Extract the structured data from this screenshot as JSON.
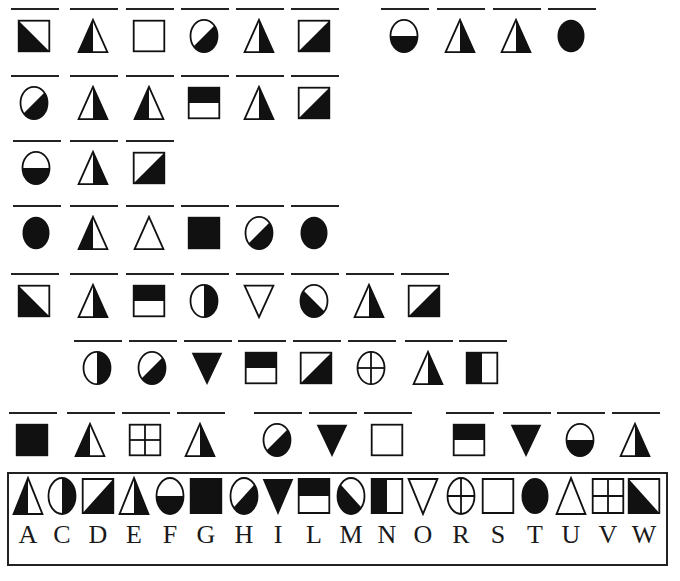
{
  "puzzle": {
    "type": "symbol-substitution-cipher",
    "rows": [
      {
        "y": 18,
        "glyphs": [
          {
            "x": 16,
            "shape": "W"
          },
          {
            "x": 75,
            "shape": "A"
          },
          {
            "x": 131,
            "shape": "S"
          },
          {
            "x": 186,
            "shape": "H"
          },
          {
            "x": 241,
            "shape": "E"
          },
          {
            "x": 296,
            "shape": "D"
          },
          {
            "x": 386,
            "shape": "F"
          },
          {
            "x": 442,
            "shape": "E"
          },
          {
            "x": 498,
            "shape": "E"
          },
          {
            "x": 553,
            "shape": "T"
          }
        ],
        "word_text": "WASHED FEET"
      },
      {
        "y": 85,
        "glyphs": [
          {
            "x": 16,
            "shape": "H"
          },
          {
            "x": 75,
            "shape": "E"
          },
          {
            "x": 131,
            "shape": "A"
          },
          {
            "x": 186,
            "shape": "L"
          },
          {
            "x": 241,
            "shape": "E"
          },
          {
            "x": 296,
            "shape": "D"
          }
        ],
        "word_text": "HEALED"
      },
      {
        "y": 150,
        "glyphs": [
          {
            "x": 18,
            "shape": "F"
          },
          {
            "x": 75,
            "shape": "E"
          },
          {
            "x": 131,
            "shape": "D"
          }
        ],
        "word_text": "FED"
      },
      {
        "y": 215,
        "glyphs": [
          {
            "x": 18,
            "shape": "T"
          },
          {
            "x": 75,
            "shape": "A"
          },
          {
            "x": 131,
            "shape": "U"
          },
          {
            "x": 186,
            "shape": "G"
          },
          {
            "x": 241,
            "shape": "H"
          },
          {
            "x": 296,
            "shape": "T"
          }
        ],
        "word_text": "TAUGHT"
      },
      {
        "y": 283,
        "glyphs": [
          {
            "x": 16,
            "shape": "W"
          },
          {
            "x": 75,
            "shape": "E"
          },
          {
            "x": 131,
            "shape": "L"
          },
          {
            "x": 186,
            "shape": "C"
          },
          {
            "x": 241,
            "shape": "O"
          },
          {
            "x": 296,
            "shape": "M"
          },
          {
            "x": 351,
            "shape": "E"
          },
          {
            "x": 406,
            "shape": "D"
          }
        ],
        "word_text": "WELCOMED"
      },
      {
        "y": 350,
        "glyphs": [
          {
            "x": 79,
            "shape": "C"
          },
          {
            "x": 134,
            "shape": "H"
          },
          {
            "x": 189,
            "shape": "I"
          },
          {
            "x": 243,
            "shape": "L"
          },
          {
            "x": 298,
            "shape": "D"
          },
          {
            "x": 353,
            "shape": "R"
          },
          {
            "x": 410,
            "shape": "E"
          },
          {
            "x": 464,
            "shape": "N"
          }
        ],
        "word_text": "CHILDREN"
      },
      {
        "y": 422,
        "glyphs": [
          {
            "x": 14,
            "shape": "G"
          },
          {
            "x": 72,
            "shape": "A"
          },
          {
            "x": 127,
            "shape": "V"
          },
          {
            "x": 182,
            "shape": "E"
          },
          {
            "x": 259,
            "shape": "H"
          },
          {
            "x": 314,
            "shape": "I"
          },
          {
            "x": 369,
            "shape": "S"
          },
          {
            "x": 451,
            "shape": "L"
          },
          {
            "x": 508,
            "shape": "I"
          },
          {
            "x": 562,
            "shape": "F"
          },
          {
            "x": 617,
            "shape": "E"
          }
        ],
        "word_text": "GAVE HIS LIFE"
      }
    ],
    "key": {
      "letters": [
        "A",
        "C",
        "D",
        "E",
        "F",
        "G",
        "H",
        "I",
        "L",
        "M",
        "N",
        "O",
        "R",
        "S",
        "T",
        "U",
        "V",
        "W"
      ],
      "xs": [
        10,
        44,
        80,
        116,
        152,
        188,
        226,
        260,
        296,
        333,
        369,
        405,
        443,
        480,
        517,
        553,
        590,
        626
      ]
    }
  }
}
